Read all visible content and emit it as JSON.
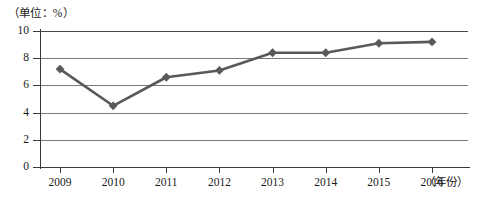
{
  "unit_label": "（单位：%）",
  "x_axis_title": "（年份）",
  "axis": {
    "y_ticks": [
      "0",
      "2",
      "4",
      "6",
      "8",
      "10"
    ],
    "x_ticks": [
      "2009",
      "2010",
      "2011",
      "2012",
      "2013",
      "2014",
      "2015",
      "2016"
    ]
  },
  "style": {
    "series_color": "#595959",
    "grid_color": "#7a7a7a",
    "axis_color": "#3a3a3a"
  },
  "chart_data": {
    "type": "line",
    "title": "",
    "subtitle": "",
    "xlabel": "（年份）",
    "ylabel": "（单位：%）",
    "categories": [
      "2009",
      "2010",
      "2011",
      "2012",
      "2013",
      "2014",
      "2015",
      "2016"
    ],
    "series": [
      {
        "name": "比率",
        "values": [
          7.2,
          4.5,
          6.6,
          7.1,
          8.4,
          8.4,
          9.1,
          9.2
        ]
      }
    ],
    "ylim": [
      0,
      10
    ],
    "y_ticks": [
      0,
      2,
      4,
      6,
      8,
      10
    ],
    "grid": true,
    "grid_axis": "y",
    "legend": false,
    "markers": "diamond"
  }
}
